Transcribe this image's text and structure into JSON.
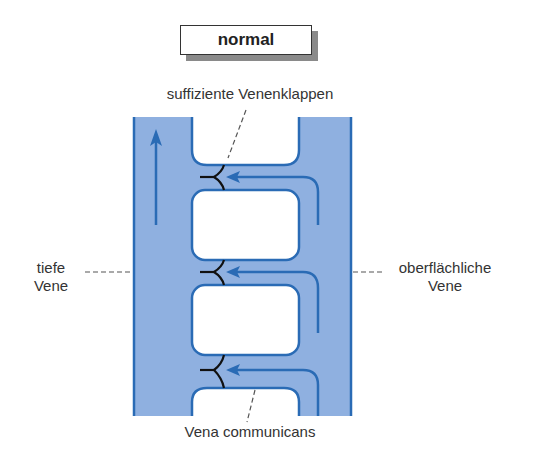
{
  "title": "normal",
  "labels": {
    "valves": "suffiziente Venenklappen",
    "deep_vein_line1": "tiefe",
    "deep_vein_line2": "Vene",
    "superficial_vein_line1": "oberflächliche",
    "superficial_vein_line2": "Vene",
    "communicating_vein": "Vena communicans"
  },
  "colors": {
    "vein_fill": "#8fb0e0",
    "vein_stroke": "#2a6bb5",
    "arrow": "#2a6bb5",
    "valve": "#111111",
    "leader_line": "#555555"
  }
}
